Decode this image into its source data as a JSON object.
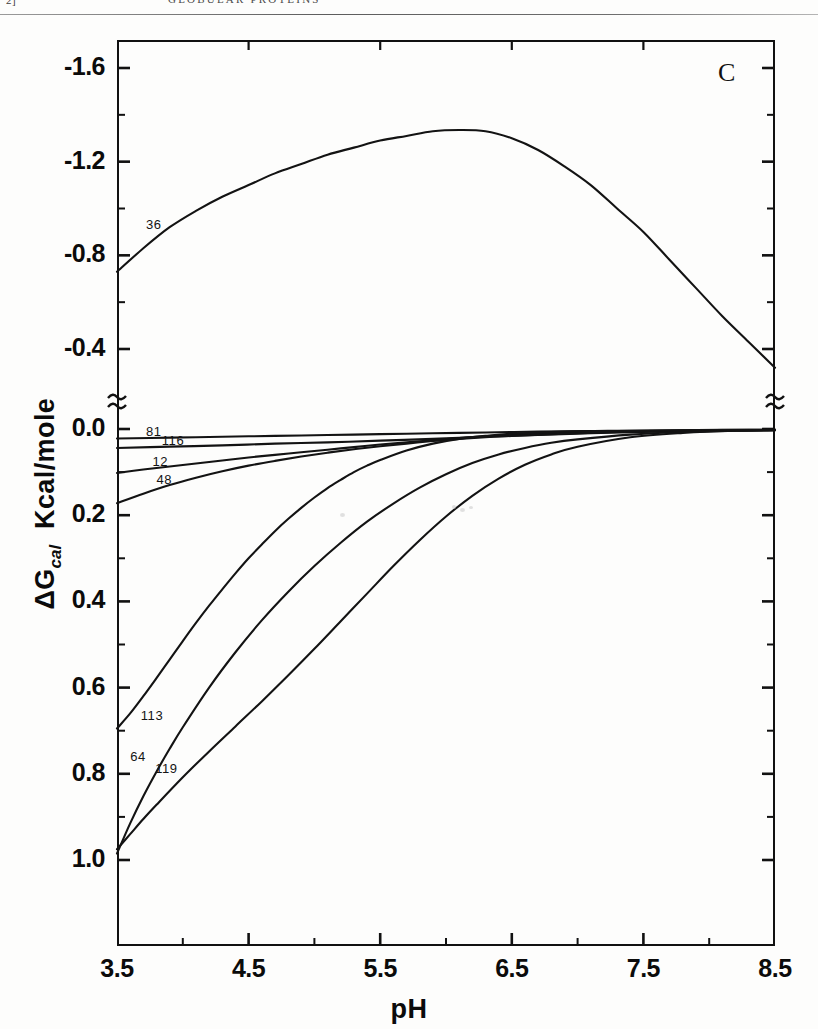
{
  "page": {
    "folio": "2]",
    "running_head": "GLOBULAR PROTEINS"
  },
  "figure": {
    "panel_letter": "C"
  },
  "chart_data": {
    "type": "line",
    "title": "",
    "subtitle": "",
    "panel": "C",
    "xlabel": "pH",
    "ylabel": "ΔGᵢₐₗ Kcal/mole",
    "ylabel_main": "ΔG",
    "ylabel_sub": "cal",
    "ylabel_unit": "Kcal/mole",
    "xlim": [
      3.5,
      8.5
    ],
    "ylim_display_top": [
      -1.8,
      0.0
    ],
    "ylim_display_bottom": [
      0.0,
      1.05
    ],
    "axis_break": true,
    "axis_break_note": "y-axis broken between -0.4 region and 0.0",
    "grid": false,
    "legend": "inline curve labels",
    "legend_position": "left, adjacent to each curve",
    "xticks": [
      3.5,
      4.5,
      5.5,
      6.5,
      7.5,
      8.5
    ],
    "xtick_labels": [
      "3.5",
      "4.5",
      "5.5",
      "6.5",
      "7.5",
      "8.5"
    ],
    "xminor_ticks": [
      4.0,
      5.0,
      6.0,
      7.0,
      8.0
    ],
    "yticks_upper": [
      -1.6,
      -1.2,
      -0.8,
      -0.4
    ],
    "ytick_labels_upper": [
      "-1.6",
      "-1.2",
      "-0.8",
      "-0.4"
    ],
    "yminor_ticks_upper": [
      -1.4,
      -1.0,
      -0.6
    ],
    "yticks_lower": [
      0.0,
      0.2,
      0.4,
      0.6,
      0.8,
      1.0
    ],
    "ytick_labels_lower": [
      "0.0",
      "0.2",
      "0.4",
      "0.6",
      "0.8",
      "1.0"
    ],
    "yminor_ticks_lower": [
      0.1,
      0.3,
      0.5,
      0.7,
      0.9
    ],
    "series": [
      {
        "name": "36",
        "label": "36",
        "label_x": 3.72,
        "label_y": -0.93,
        "panel": "upper",
        "x": [
          3.5,
          3.7,
          3.9,
          4.1,
          4.3,
          4.5,
          4.7,
          4.9,
          5.1,
          5.3,
          5.5,
          5.7,
          5.9,
          6.1,
          6.3,
          6.5,
          6.7,
          6.9,
          7.1,
          7.3,
          7.5,
          7.7,
          7.9,
          8.1,
          8.3,
          8.5
        ],
        "values": [
          -0.73,
          -0.83,
          -0.92,
          -0.99,
          -1.05,
          -1.1,
          -1.15,
          -1.19,
          -1.23,
          -1.26,
          -1.29,
          -1.31,
          -1.33,
          -1.335,
          -1.33,
          -1.3,
          -1.25,
          -1.18,
          -1.1,
          -1.0,
          -0.9,
          -0.78,
          -0.66,
          -0.54,
          -0.43,
          -0.32
        ]
      },
      {
        "name": "81",
        "label": "81",
        "label_x": 3.72,
        "label_y": 0.007,
        "panel": "lower",
        "x": [
          3.5,
          3.9,
          4.3,
          4.7,
          5.1,
          5.5,
          5.9,
          6.3,
          6.7,
          7.1,
          7.5,
          7.9,
          8.3,
          8.5
        ],
        "values": [
          0.022,
          0.02,
          0.018,
          0.016,
          0.014,
          0.012,
          0.01,
          0.008,
          0.006,
          0.005,
          0.004,
          0.003,
          0.002,
          0.002
        ]
      },
      {
        "name": "116",
        "label": "116",
        "label_x": 3.84,
        "label_y": 0.028,
        "panel": "lower",
        "x": [
          3.5,
          3.9,
          4.3,
          4.7,
          5.1,
          5.5,
          5.9,
          6.3,
          6.7,
          7.1,
          7.5,
          7.9,
          8.3,
          8.5
        ],
        "values": [
          0.044,
          0.041,
          0.038,
          0.034,
          0.031,
          0.027,
          0.023,
          0.018,
          0.014,
          0.01,
          0.007,
          0.005,
          0.003,
          0.003
        ]
      },
      {
        "name": "12",
        "label": "12",
        "label_x": 3.77,
        "label_y": 0.077,
        "panel": "lower",
        "x": [
          3.5,
          3.7,
          3.9,
          4.1,
          4.3,
          4.5,
          4.7,
          4.9,
          5.1,
          5.3,
          5.5,
          5.7,
          5.9,
          6.1,
          6.3,
          6.5,
          6.9,
          7.3,
          7.7,
          8.1,
          8.5
        ],
        "values": [
          0.102,
          0.094,
          0.087,
          0.08,
          0.073,
          0.066,
          0.06,
          0.054,
          0.048,
          0.042,
          0.036,
          0.031,
          0.026,
          0.021,
          0.017,
          0.014,
          0.009,
          0.006,
          0.004,
          0.003,
          0.002
        ]
      },
      {
        "name": "48",
        "label": "48",
        "label_x": 3.8,
        "label_y": 0.118,
        "panel": "lower",
        "x": [
          3.5,
          3.7,
          3.9,
          4.1,
          4.3,
          4.5,
          4.7,
          4.9,
          5.1,
          5.3,
          5.5,
          5.7,
          5.9,
          6.1,
          6.3,
          6.5,
          6.9,
          7.3,
          7.7,
          8.1,
          8.5
        ],
        "values": [
          0.172,
          0.15,
          0.13,
          0.113,
          0.098,
          0.085,
          0.074,
          0.064,
          0.055,
          0.047,
          0.04,
          0.034,
          0.028,
          0.023,
          0.019,
          0.016,
          0.011,
          0.007,
          0.005,
          0.003,
          0.002
        ]
      },
      {
        "name": "113",
        "label": "113",
        "label_x": 3.68,
        "label_y": 0.665,
        "panel": "lower",
        "x": [
          3.5,
          3.6,
          3.7,
          3.8,
          3.9,
          4.0,
          4.1,
          4.2,
          4.3,
          4.4,
          4.5,
          4.6,
          4.7,
          4.8,
          4.9,
          5.0,
          5.1,
          5.2,
          5.3,
          5.4,
          5.5,
          5.7,
          5.9,
          6.1,
          6.3,
          6.5,
          6.9,
          7.3,
          7.7,
          8.1,
          8.5
        ],
        "values": [
          0.695,
          0.66,
          0.62,
          0.578,
          0.535,
          0.492,
          0.45,
          0.41,
          0.372,
          0.335,
          0.3,
          0.268,
          0.237,
          0.209,
          0.183,
          0.159,
          0.137,
          0.118,
          0.1,
          0.085,
          0.072,
          0.05,
          0.034,
          0.023,
          0.016,
          0.011,
          0.006,
          0.004,
          0.003,
          0.002,
          0.002
        ]
      },
      {
        "name": "64",
        "label": "64",
        "label_x": 3.6,
        "label_y": 0.762,
        "panel": "lower",
        "x": [
          3.5,
          3.6,
          3.7,
          3.8,
          3.9,
          4.0,
          4.2,
          4.4,
          4.6,
          4.8,
          5.0,
          5.2,
          5.4,
          5.6,
          5.8,
          6.0,
          6.2,
          6.4,
          6.6,
          6.8,
          7.0,
          7.4,
          7.8,
          8.2,
          8.5
        ],
        "values": [
          0.985,
          0.915,
          0.852,
          0.795,
          0.742,
          0.692,
          0.6,
          0.518,
          0.444,
          0.378,
          0.318,
          0.264,
          0.215,
          0.173,
          0.136,
          0.105,
          0.079,
          0.059,
          0.044,
          0.032,
          0.024,
          0.013,
          0.007,
          0.004,
          0.003
        ]
      },
      {
        "name": "119",
        "label": "119",
        "label_x": 3.79,
        "label_y": 0.79,
        "panel": "lower",
        "x": [
          3.5,
          3.6,
          3.7,
          3.8,
          4.0,
          4.2,
          4.4,
          4.6,
          4.8,
          5.0,
          5.2,
          5.4,
          5.6,
          5.8,
          6.0,
          6.2,
          6.4,
          6.6,
          6.8,
          7.0,
          7.4,
          7.8,
          8.2,
          8.5
        ],
        "values": [
          0.975,
          0.94,
          0.905,
          0.872,
          0.808,
          0.748,
          0.69,
          0.632,
          0.572,
          0.51,
          0.446,
          0.382,
          0.318,
          0.258,
          0.203,
          0.155,
          0.115,
          0.083,
          0.059,
          0.041,
          0.019,
          0.009,
          0.004,
          0.003
        ]
      }
    ]
  }
}
